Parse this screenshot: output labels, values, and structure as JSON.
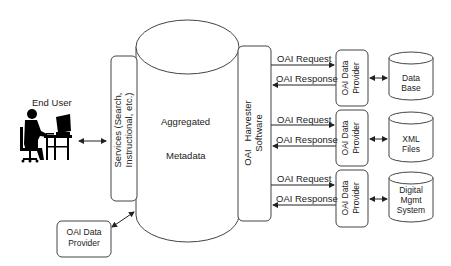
{
  "end_user": {
    "label": "End User"
  },
  "services": {
    "line1": "Services (Search,",
    "line2": "Instructional, etc.)"
  },
  "aggregated": {
    "line1": "Aggregated",
    "line2": "Metadata"
  },
  "harvester": {
    "line1": "OAI   Harvester",
    "line2": "Software"
  },
  "local_provider": {
    "line1": "OAI Data",
    "line2": "Provider"
  },
  "messages": {
    "request": "OAI Request",
    "response": "OAI Response"
  },
  "providers": [
    {
      "line1": "OAI Data",
      "line2": "Provider",
      "store": [
        "Data",
        "Base"
      ]
    },
    {
      "line1": "OAI Data",
      "line2": "Provider",
      "store": [
        "XML",
        "Files"
      ]
    },
    {
      "line1": "OAI Data",
      "line2": "Provider",
      "store": [
        "Digital",
        "Mgmt",
        "System"
      ]
    }
  ]
}
